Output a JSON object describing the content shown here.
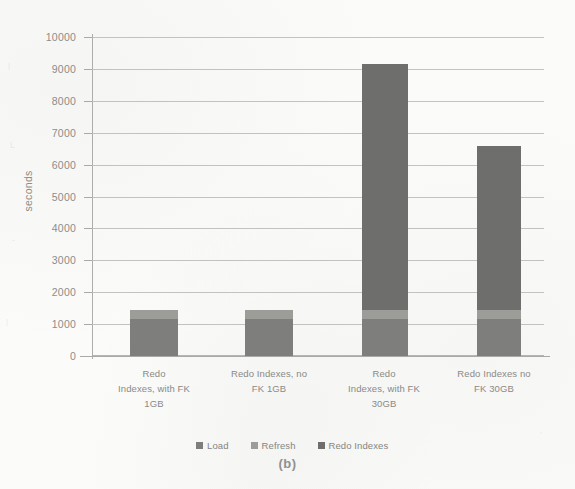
{
  "chart_data": {
    "type": "bar",
    "title": "",
    "subtitle": "",
    "caption": "(b)",
    "xlabel": "",
    "ylabel": "seconds",
    "ylim": [
      0,
      10000
    ],
    "ytick_step": 1000,
    "yticks": [
      "10000",
      "9000",
      "8000",
      "7000",
      "6000",
      "5000",
      "4000",
      "3000",
      "2000",
      "1000",
      "0"
    ],
    "grid": true,
    "legend_position": "bottom",
    "stacked": true,
    "categories": [
      "Redo Indexes, with FK 1GB",
      "Redo Indexes, no FK 1GB",
      "Redo Indexes, with FK 30GB",
      "Redo Indexes no FK 30GB"
    ],
    "category_lines": [
      [
        "Redo",
        "Indexes, with FK",
        "1GB"
      ],
      [
        "Redo Indexes, no",
        "FK 1GB"
      ],
      [
        "Redo",
        "Indexes, with FK",
        "30GB"
      ],
      [
        "Redo Indexes no",
        "FK 30GB"
      ]
    ],
    "series": [
      {
        "name": "Load",
        "color": "#7e7e7c",
        "values": [
          1150,
          1150,
          1150,
          1150
        ]
      },
      {
        "name": "Refresh",
        "color": "#9c9c99",
        "values": [
          300,
          300,
          300,
          300
        ]
      },
      {
        "name": "Redo Indexes",
        "color": "#6e6e6c",
        "values": [
          0,
          0,
          7740,
          5140
        ]
      }
    ],
    "totals": [
      1450,
      1450,
      9190,
      6590
    ]
  },
  "colors": {
    "plot_background": "#fbfbfa",
    "gridline": "#b9b9b6",
    "axis": "#a9a9a6",
    "tick_text": "#8d8d89",
    "label_text": "#8a8a86"
  },
  "ghost_marks": [
    {
      "text": "l",
      "x": 8,
      "y": 62
    },
    {
      "text": "L",
      "x": 10,
      "y": 140
    },
    {
      "text": "-",
      "x": 12,
      "y": 235
    },
    {
      "text": "l",
      "x": 6,
      "y": 318
    },
    {
      "text": "'",
      "x": 540,
      "y": 430
    }
  ]
}
